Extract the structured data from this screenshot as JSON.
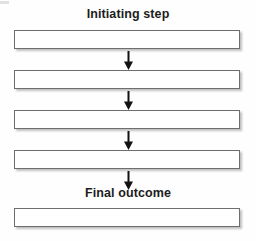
{
  "diagram": {
    "type": "vertical-flowchart",
    "background_color": "#fefefe",
    "box_fill_color": "#ffffff",
    "box_border_color": "#6e6e6e",
    "arrow_color": "#111111",
    "text_color": "#1c1c1c",
    "labels": {
      "initiating": "Initiating step",
      "final": "Final outcome"
    },
    "boxes": [
      {
        "id": "box-1",
        "text": ""
      },
      {
        "id": "box-2",
        "text": ""
      },
      {
        "id": "box-3",
        "text": ""
      },
      {
        "id": "box-4",
        "text": ""
      },
      {
        "id": "box-5",
        "text": ""
      }
    ],
    "arrows": [
      {
        "id": "arrow-1",
        "direction": "down",
        "from": "box-1",
        "to": "box-2"
      },
      {
        "id": "arrow-2",
        "direction": "down",
        "from": "box-2",
        "to": "box-3"
      },
      {
        "id": "arrow-3",
        "direction": "down",
        "from": "box-3",
        "to": "box-4"
      },
      {
        "id": "arrow-4",
        "direction": "down",
        "from": "box-4",
        "to": "box-5"
      }
    ]
  }
}
